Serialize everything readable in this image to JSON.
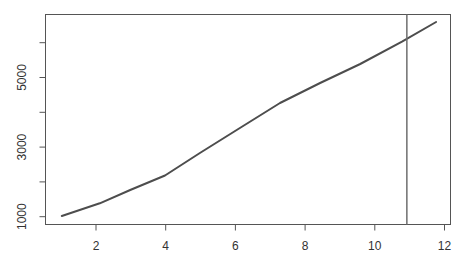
{
  "chart_data": {
    "type": "line",
    "title": "",
    "xlabel": "",
    "ylabel": "",
    "xlim": [
      0.55,
      12.2
    ],
    "ylim": [
      800,
      6620
    ],
    "x_ticks": [
      2,
      4,
      6,
      8,
      10,
      12
    ],
    "x_tick_labels": [
      "2",
      "4",
      "6",
      "8",
      "10",
      "12"
    ],
    "y_ticks": [
      1000,
      2000,
      3000,
      4000,
      5000,
      6000
    ],
    "y_tick_labels": [
      "1000",
      "",
      "3000",
      "",
      "5000",
      ""
    ],
    "grid": false,
    "legend": null,
    "series": [
      {
        "name": "series",
        "color": "#4d4d4d",
        "x": [
          1.02,
          2.11,
          2.98,
          3.98,
          4.98,
          6.13,
          7.28,
          8.43,
          9.58,
          10.78,
          11.76
        ],
        "y": [
          1020,
          1385,
          1767,
          2184,
          2830,
          3549,
          4267,
          4842,
          5388,
          6029,
          6595
        ]
      }
    ],
    "annotations": [
      {
        "type": "vline",
        "x": 10.92,
        "color": "#6e6e6e"
      }
    ]
  },
  "colors": {
    "axis": "#555555",
    "line": "#4d4d4d",
    "vline": "#6e6e6e",
    "text": "#333333"
  }
}
